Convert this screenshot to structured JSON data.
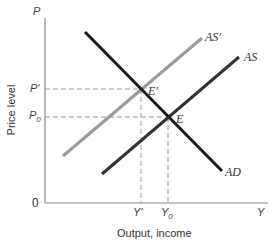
{
  "diagram": {
    "axes": {
      "y_axis_symbol": "P",
      "x_axis_symbol": "Y",
      "origin": "0",
      "y_label": "Price level",
      "x_label": "Output, income"
    },
    "y_ticks": {
      "p_prime": "P'",
      "p0_base": "P",
      "p0_sub": "0"
    },
    "x_ticks": {
      "y_prime": "Y'",
      "y0_base": "Y",
      "y0_sub": "0"
    },
    "curves": {
      "ad": "AD",
      "as": "AS",
      "as_prime": "AS'"
    },
    "points": {
      "e": "E",
      "e_prime": "E'"
    },
    "colors": {
      "ad": "#1a1a1a",
      "as": "#333333",
      "as_prime": "#9a9a9a",
      "axis": "#888888",
      "dashed": "#999999"
    }
  }
}
